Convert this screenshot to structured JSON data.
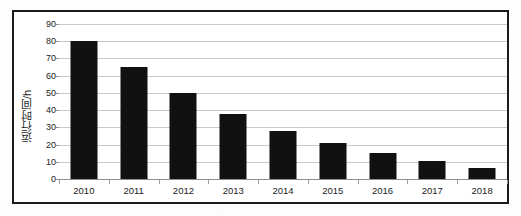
{
  "chart_data": {
    "type": "bar",
    "title": "",
    "xlabel": "",
    "ylabel": "运行时间/h",
    "categories": [
      "2010",
      "2011",
      "2012",
      "2013",
      "2014",
      "2015",
      "2016",
      "2017",
      "2018"
    ],
    "values": [
      80,
      65,
      50,
      38,
      28,
      21,
      15,
      10.5,
      6.5
    ],
    "ylim": [
      0,
      90
    ],
    "yticks": [
      0,
      10,
      20,
      30,
      40,
      50,
      60,
      70,
      80,
      90
    ],
    "ytick_labels": [
      "0",
      "10",
      "20",
      "30",
      "40",
      "50",
      "60",
      "70",
      "80",
      "90"
    ],
    "grid": true,
    "legend": false,
    "series": [
      {
        "name": "运行时间",
        "values": [
          80,
          65,
          50,
          38,
          28,
          21,
          15,
          10.5,
          6.5
        ]
      }
    ],
    "colors": {
      "bar": "#111111",
      "gridline": "#c9c9c9",
      "axis": "#8e8e8e",
      "frame": "#1b1b1b",
      "plot_background": "#ffffff",
      "text": "#1b1b1b"
    }
  }
}
